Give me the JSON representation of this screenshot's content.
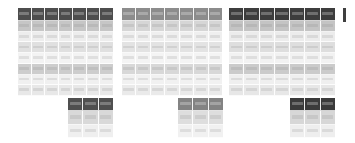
{
  "document": {
    "title": "Table thumbnail strip",
    "background_color": "#ffffff",
    "width": 355,
    "height": 143
  },
  "palette": {
    "page_background": "#ffffff",
    "grid_line": "#ffffff",
    "header_dark": "#4d4d4d",
    "header_medium": "#8c8c8c",
    "header_darkest": "#3d3d3d",
    "row_band_strong": "#bdbdbd",
    "row_band_light": "#e4e4e4",
    "row_band_faint": "#efefef",
    "row_band_pale": "#f5f5f5"
  },
  "tables": [
    {
      "id": "table-1",
      "name": "large-table-1",
      "x": 18,
      "y": 8,
      "width": 95,
      "height": 88,
      "columns": 7,
      "header": {
        "height": 13,
        "fill": "#4d4d4d"
      },
      "rows": [
        {
          "fill": "#c6c6c6"
        },
        {
          "fill": "#ededed"
        },
        {
          "fill": "#e0e0e0"
        },
        {
          "fill": "#f3f3f3"
        },
        {
          "fill": "#cdcdcd"
        },
        {
          "fill": "#f0f0f0"
        },
        {
          "fill": "#e8e8e8"
        }
      ]
    },
    {
      "id": "table-2",
      "name": "large-table-2",
      "x": 122,
      "y": 8,
      "width": 100,
      "height": 88,
      "columns": 7,
      "header": {
        "height": 13,
        "fill": "#8c8c8c"
      },
      "rows": [
        {
          "fill": "#d6d6d6"
        },
        {
          "fill": "#efefef"
        },
        {
          "fill": "#e3e3e3"
        },
        {
          "fill": "#f4f4f4"
        },
        {
          "fill": "#d8d8d8"
        },
        {
          "fill": "#f1f1f1"
        },
        {
          "fill": "#eaeaea"
        }
      ]
    },
    {
      "id": "table-3",
      "name": "large-table-3",
      "x": 229,
      "y": 8,
      "width": 106,
      "height": 88,
      "columns": 7,
      "header": {
        "height": 13,
        "fill": "#3d3d3d"
      },
      "rows": [
        {
          "fill": "#c4c4c4"
        },
        {
          "fill": "#ececec"
        },
        {
          "fill": "#dedede"
        },
        {
          "fill": "#f2f2f2"
        },
        {
          "fill": "#cbcbcb"
        },
        {
          "fill": "#efefef"
        },
        {
          "fill": "#e7e7e7"
        }
      ]
    }
  ],
  "subtables": [
    {
      "id": "subtable-1",
      "name": "small-table-1",
      "x": 68,
      "y": 98,
      "width": 45,
      "height": 40,
      "columns": 3,
      "header": {
        "height": 13,
        "fill": "#4f4f4f"
      },
      "rows": [
        {
          "fill": "#d9d9d9"
        },
        {
          "fill": "#efefef"
        }
      ]
    },
    {
      "id": "subtable-2",
      "name": "small-table-2",
      "x": 178,
      "y": 98,
      "width": 45,
      "height": 40,
      "columns": 3,
      "header": {
        "height": 13,
        "fill": "#838383"
      },
      "rows": [
        {
          "fill": "#dedede"
        },
        {
          "fill": "#f1f1f1"
        }
      ]
    },
    {
      "id": "subtable-3",
      "name": "small-table-3",
      "x": 290,
      "y": 98,
      "width": 45,
      "height": 40,
      "columns": 3,
      "header": {
        "height": 13,
        "fill": "#3a3a3a"
      },
      "rows": [
        {
          "fill": "#d7d7d7"
        },
        {
          "fill": "#eeeeee"
        }
      ]
    }
  ],
  "edge_fragment": {
    "id": "edge-fragment",
    "name": "cutoff-table-fragment",
    "x": 343,
    "y": 8,
    "width": 3,
    "height": 14,
    "fill": "#3f3f3f"
  }
}
